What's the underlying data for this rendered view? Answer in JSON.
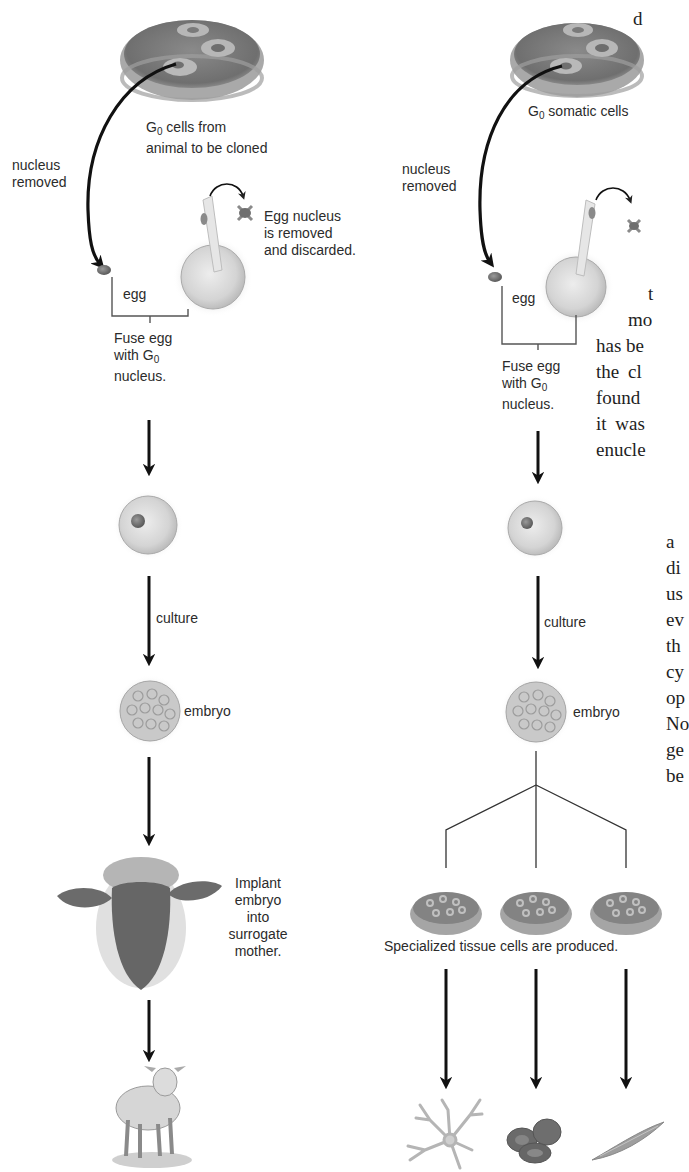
{
  "left_panel": {
    "title": "Reproductive cloning",
    "source_label_prefix": "G",
    "source_label_sub": "0",
    "source_label_line1": " cells from",
    "source_label_line2": "animal to be cloned",
    "nucleus_removed_line1": "nucleus",
    "nucleus_removed_line2": "removed",
    "egg_nucleus_line1": "Egg nucleus",
    "egg_nucleus_line2": "is removed",
    "egg_nucleus_line3": "and discarded.",
    "egg_label": "egg",
    "fuse_line1": "Fuse egg",
    "fuse_line2_prefix": "with G",
    "fuse_line2_sub": "0",
    "fuse_line3": "nucleus.",
    "culture_label": "culture",
    "embryo_label": "embryo",
    "implant_line1": "Implant",
    "implant_line2": "embryo",
    "implant_line3": "into",
    "implant_line4": "surrogate",
    "implant_line5": "mother.",
    "icons": [
      "petri-dish-icon",
      "egg-nucleus-discard-icon",
      "micropipette-egg-icon",
      "fused-cell-icon",
      "embryo-icon",
      "sheep-head-icon",
      "lamb-icon"
    ]
  },
  "right_panel": {
    "title": "Therapeutic cloning",
    "source_label_prefix": "G",
    "source_label_sub": "0",
    "source_label_rest": " somatic cells",
    "nucleus_removed_line1": "nucleus",
    "nucleus_removed_line2": "removed",
    "egg_label": "egg",
    "fuse_line1": "Fuse egg",
    "fuse_line2_prefix": "with G",
    "fuse_line2_sub": "0",
    "fuse_line3": "nucleus.",
    "culture_label": "culture",
    "embryo_label": "embryo",
    "specialized_label": "Specialized tissue cells are produced.",
    "cell_types": [
      "nerve-cell-icon",
      "red-blood-cells-icon",
      "muscle-cell-icon"
    ]
  },
  "clipped_text": {
    "lines": [
      {
        "text": "d",
        "x": 633,
        "y": 8
      },
      {
        "text": "t",
        "x": 648,
        "y": 285
      },
      {
        "text": "mo",
        "x": 628,
        "y": 311
      },
      {
        "text": "has be",
        "x": 596,
        "y": 337
      },
      {
        "text": "the  cl",
        "x": 596,
        "y": 363
      },
      {
        "text": "found",
        "x": 596,
        "y": 389
      },
      {
        "text": "it  was",
        "x": 596,
        "y": 415
      },
      {
        "text": "enucle",
        "x": 596,
        "y": 441
      },
      {
        "text": "a",
        "x": 666,
        "y": 533
      },
      {
        "text": "di",
        "x": 666,
        "y": 559
      },
      {
        "text": "us",
        "x": 666,
        "y": 585
      },
      {
        "text": "ev",
        "x": 666,
        "y": 611
      },
      {
        "text": "th",
        "x": 666,
        "y": 637
      },
      {
        "text": "cy",
        "x": 666,
        "y": 663
      },
      {
        "text": "op",
        "x": 666,
        "y": 689
      },
      {
        "text": "No",
        "x": 666,
        "y": 715
      },
      {
        "text": "ge",
        "x": 666,
        "y": 741
      },
      {
        "text": "be",
        "x": 666,
        "y": 767
      }
    ]
  }
}
